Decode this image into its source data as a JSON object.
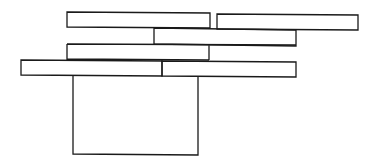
{
  "diagram": {
    "stroke_color": "#1a1a1a",
    "background_color": "#ffffff",
    "shapes": [
      {
        "id": "row1-left",
        "x": 67,
        "y": 12,
        "w": 143,
        "h": 16
      },
      {
        "id": "row1-right",
        "x": 217,
        "y": 14,
        "w": 141,
        "h": 16
      },
      {
        "id": "row2",
        "x": 154,
        "y": 29,
        "w": 142,
        "h": 16
      },
      {
        "id": "row3",
        "x": 67,
        "y": 44,
        "w": 142,
        "h": 16
      },
      {
        "id": "row4-left",
        "x": 21,
        "y": 60,
        "w": 141,
        "h": 16
      },
      {
        "id": "row4-right",
        "x": 162,
        "y": 61,
        "w": 134,
        "h": 16
      },
      {
        "id": "base",
        "x": 73,
        "y": 76,
        "w": 125,
        "h": 79
      }
    ]
  }
}
